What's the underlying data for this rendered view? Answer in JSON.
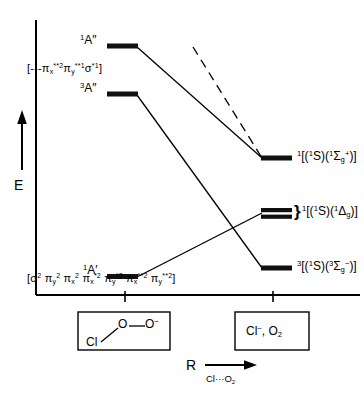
{
  "diagram": {
    "type": "state-correlation-diagram",
    "axes": {
      "y_label": "E",
      "y_direction": "up",
      "x_label": "R",
      "x_sublabel_prefix": "Cl",
      "x_sublabel_dots": "···",
      "x_sublabel_species": "O",
      "x_sublabel_species_sub": "2",
      "x_tick_count": 2
    },
    "left_states": [
      {
        "id": "1Apr",
        "multiplicity": "1",
        "term": "A″",
        "label_plain": "¹A″",
        "level_y_frac": 0.115,
        "correlates_to": "1SigmaG+"
      },
      {
        "id": "3Apr",
        "multiplicity": "3",
        "term": "A″",
        "label_plain": "³A″",
        "level_y_frac": 0.245,
        "correlates_to": "3SigmaG-"
      },
      {
        "id": "1Ap",
        "multiplicity": "1",
        "term": "A′",
        "label_plain": "¹A′",
        "level_y_frac": 0.695,
        "correlates_to": "1DeltaG"
      }
    ],
    "configurations": {
      "excited": {
        "open_bracket": "[",
        "dashes": "---",
        "terms": [
          {
            "sym": "π",
            "sub": "x",
            "sup": "**2"
          },
          {
            "sym": "π",
            "sub": "y",
            "sup": "**1"
          },
          {
            "sym": "σ",
            "sub": "",
            "sup": "*1"
          }
        ],
        "close_bracket": "]"
      },
      "ground": {
        "open_bracket": "[",
        "terms": [
          {
            "sym": "σ",
            "sub": "",
            "sup": "2"
          },
          {
            "sym": "π",
            "sub": "y",
            "sup": "2"
          },
          {
            "sym": "π",
            "sub": "x",
            "sup": "2"
          },
          {
            "sym": "π",
            "sub": "x",
            "sup": "*2"
          },
          {
            "sym": "π",
            "sub": "y",
            "sup": "*2"
          },
          {
            "sym": "π",
            "sub": "x",
            "sup": "**2"
          },
          {
            "sym": "π",
            "sub": "y",
            "sup": "**2"
          }
        ],
        "close_bracket": "]"
      }
    },
    "right_states": [
      {
        "id": "1SigmaG+",
        "label_plain": "¹[(¹S)(¹Σg⁺)]",
        "multiplicity": "1",
        "atom_mult": "1",
        "atom_term": "S",
        "mol_mult": "1",
        "mol_term": "Σ",
        "mol_sub": "g",
        "mol_sup": "+",
        "level_y_frac": 0.395,
        "braced": false
      },
      {
        "id": "1DeltaG",
        "label_plain": "¹[(¹S)(¹Δg)]",
        "multiplicity": "1",
        "atom_mult": "1",
        "atom_term": "S",
        "mol_mult": "1",
        "mol_term": "Δ",
        "mol_sub": "g",
        "mol_sup": "",
        "level_y_frac": 0.545,
        "braced": true,
        "brace_glyph": "}",
        "sublevels": 2
      },
      {
        "id": "3SigmaG-",
        "label_plain": "³[(¹S)(³Σg⁻)]",
        "multiplicity": "3",
        "atom_mult": "1",
        "atom_term": "S",
        "mol_mult": "3",
        "mol_term": "Σ",
        "mol_sub": "g",
        "mol_sup": "−",
        "level_y_frac": 0.695,
        "braced": false
      }
    ],
    "dashed_line": {
      "present": true,
      "style": "dashed",
      "note": "upper correlation line entering from top, meeting the ¹Σg⁺ level"
    },
    "reactant_box": {
      "formula_plain": "Cl—O—O⁻",
      "atom_cl": "Cl",
      "atom_o1": "O",
      "atom_o2": "O",
      "charge": "−"
    },
    "product_box": {
      "formula_plain": "Cl⁻, O₂",
      "anion": "Cl",
      "anion_charge": "−",
      "separator": ",",
      "molecule": "O",
      "molecule_sub": "2"
    },
    "colors": {
      "ink": "#000000",
      "background": "#ffffff",
      "level_bar": "#111111"
    }
  }
}
